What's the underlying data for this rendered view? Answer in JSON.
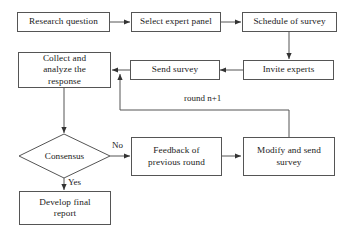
{
  "diagram": {
    "background_color": "#ffffff",
    "line_color": "#555555",
    "text_color": "#1a1a1a",
    "nodes": [
      {
        "id": "research_question",
        "label": "Research question",
        "shape": "rect"
      },
      {
        "id": "select_expert_panel",
        "label": "Select expert panel",
        "shape": "rect"
      },
      {
        "id": "schedule_of_survey",
        "label": "Schedule of survey",
        "shape": "rect"
      },
      {
        "id": "collect_analyze",
        "label": "Collect and\nanalyze the\nresponse",
        "shape": "rect"
      },
      {
        "id": "send_survey",
        "label": "Send survey",
        "shape": "rect"
      },
      {
        "id": "invite_experts",
        "label": "Invite experts",
        "shape": "rect"
      },
      {
        "id": "consensus",
        "label": "Consensus",
        "shape": "diamond"
      },
      {
        "id": "feedback_previous",
        "label": "Feedback of\nprevious round",
        "shape": "rect"
      },
      {
        "id": "modify_send",
        "label": "Modify and send\nsurvey",
        "shape": "rect"
      },
      {
        "id": "develop_report",
        "label": "Develop final\nreport",
        "shape": "rect"
      }
    ],
    "edge_labels": {
      "round_next": "round n+1",
      "no": "No",
      "yes": "Yes"
    }
  }
}
